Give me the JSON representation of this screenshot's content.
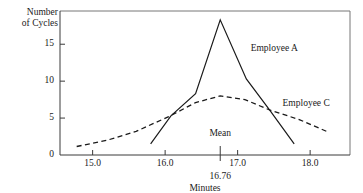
{
  "chart_data": {
    "type": "line",
    "title": "",
    "xlabel": "Minutes",
    "ylabel": "Number of Cycles",
    "ylabel_line1": "Number",
    "ylabel_line2": "of Cycles",
    "xlim": [
      14.55,
      18.55
    ],
    "ylim": [
      0,
      19.5
    ],
    "xticks": [
      15.0,
      16.0,
      17.0,
      18.0
    ],
    "xtick_labels": [
      "15.0",
      "16.0",
      "17.0",
      "18.0"
    ],
    "yticks": [
      0,
      5,
      10,
      15
    ],
    "ytick_labels": [
      "0",
      "5",
      "10",
      "15"
    ],
    "grid": false,
    "legend_position": "inline-annotation",
    "annotations": [
      {
        "name": "mean-marker",
        "label": "Mean",
        "value_label": "16.76",
        "x": 16.76
      }
    ],
    "series": [
      {
        "name": "Employee A",
        "style": "solid",
        "label": "Employee A",
        "label_x": 17.18,
        "label_y": 14.3,
        "x": [
          15.8,
          16.08,
          16.42,
          16.76,
          17.12,
          17.44,
          17.78
        ],
        "y": [
          1.5,
          5.3,
          8.3,
          18.3,
          10.3,
          6.1,
          1.5
        ]
      },
      {
        "name": "Employee C",
        "style": "dashed",
        "label": "Employee C",
        "label_x": 17.62,
        "label_y": 6.9,
        "x": [
          14.78,
          15.2,
          15.6,
          16.05,
          16.42,
          16.76,
          17.1,
          17.44,
          17.85,
          18.25
        ],
        "y": [
          1.15,
          2.0,
          3.2,
          5.2,
          7.1,
          8.0,
          7.5,
          6.1,
          4.8,
          3.1
        ]
      }
    ]
  }
}
